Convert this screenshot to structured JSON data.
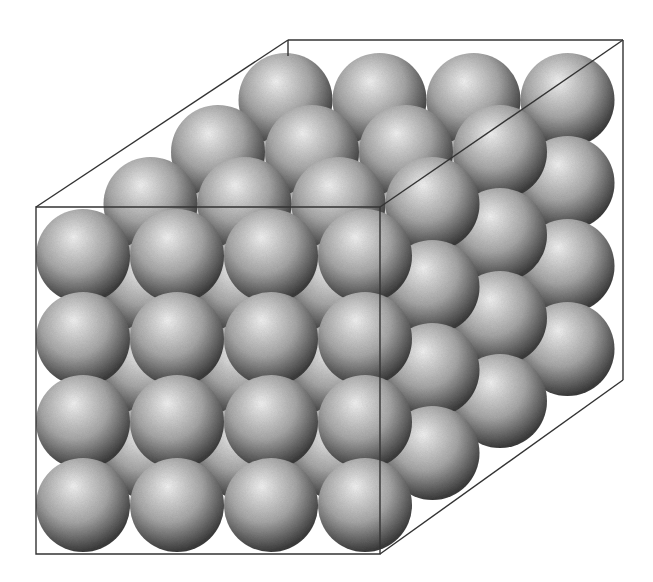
{
  "diagram": {
    "lattice": {
      "nx": 4,
      "ny": 4,
      "nz": 4
    },
    "sphere": {
      "radius": 47,
      "light": "#f4f4f4",
      "mid": "#a8a8a8",
      "dark": "#3c3c3c"
    },
    "front_origin": {
      "x": 83,
      "y": 256
    },
    "spacing": {
      "dx": 94,
      "dy": 83
    },
    "depth_step": {
      "dx": 67.5,
      "dy": -52
    },
    "box": {
      "stroke": "#333333",
      "front": [
        [
          36,
          207
        ],
        [
          380,
          207
        ],
        [
          380,
          554
        ],
        [
          36,
          554
        ]
      ],
      "edges": [
        [
          [
            36,
            207
          ],
          [
            288,
            40
          ]
        ],
        [
          [
            288,
            40
          ],
          [
            623,
            40
          ]
        ],
        [
          [
            623,
            40
          ],
          [
            380,
            207
          ]
        ],
        [
          [
            623,
            40
          ],
          [
            623,
            380
          ]
        ],
        [
          [
            623,
            380
          ],
          [
            380,
            554
          ]
        ],
        [
          [
            288,
            40
          ],
          [
            288,
            56
          ]
        ]
      ]
    }
  }
}
